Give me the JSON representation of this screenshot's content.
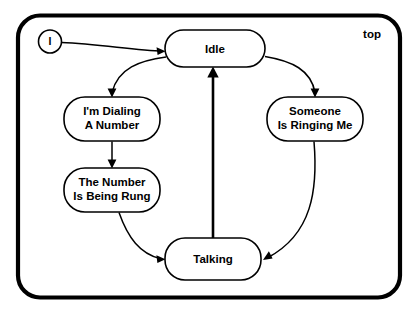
{
  "diagram": {
    "type": "state-machine-diagram",
    "region_label": "top",
    "initial_state_marker": "I",
    "states": [
      {
        "id": "idle",
        "label_lines": [
          "Idle"
        ],
        "cx": 215,
        "cy": 48.5,
        "w": 100,
        "h": 37
      },
      {
        "id": "dialing",
        "label_lines": [
          "I'm Dialing",
          "A Number"
        ],
        "cx": 112,
        "cy": 119,
        "w": 96,
        "h": 44
      },
      {
        "id": "ringing",
        "label_lines": [
          "The Number",
          "Is Being Rung"
        ],
        "cx": 112,
        "cy": 190,
        "w": 96,
        "h": 44
      },
      {
        "id": "someone",
        "label_lines": [
          "Someone",
          "Is Ringing Me"
        ],
        "cx": 315,
        "cy": 119,
        "w": 96,
        "h": 44
      },
      {
        "id": "talking",
        "label_lines": [
          "Talking"
        ],
        "cx": 213,
        "cy": 259,
        "w": 96,
        "h": 42
      }
    ],
    "transitions": [
      {
        "id": "t-init-idle",
        "from": "initial",
        "to": "idle",
        "label": ""
      },
      {
        "id": "t-idle-dialing",
        "from": "idle",
        "to": "dialing",
        "label": ""
      },
      {
        "id": "t-dialing-ringing",
        "from": "dialing",
        "to": "ringing",
        "label": ""
      },
      {
        "id": "t-ringing-talking",
        "from": "ringing",
        "to": "talking",
        "label": ""
      },
      {
        "id": "t-idle-someone",
        "from": "idle",
        "to": "someone",
        "label": ""
      },
      {
        "id": "t-someone-talking",
        "from": "someone",
        "to": "talking",
        "label": ""
      },
      {
        "id": "t-talking-idle",
        "from": "talking",
        "to": "idle",
        "label": ""
      }
    ],
    "colors": {
      "background": "#ffffff",
      "stroke": "#000000",
      "fill": "#ffffff"
    }
  }
}
